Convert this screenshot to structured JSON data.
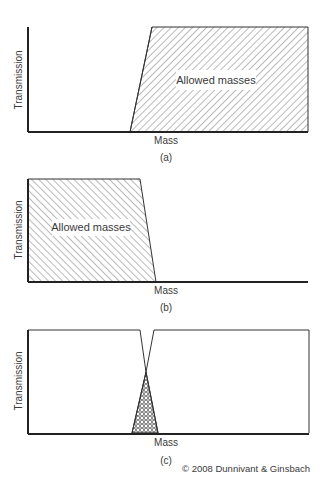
{
  "figure": {
    "copyright": "© 2008 Dunnivant & Ginsbach",
    "panels": [
      {
        "id": "a",
        "caption": "(a)",
        "xlabel": "Mass",
        "ylabel": "Transmission",
        "region_label": "Allowed masses",
        "filter": "high-pass"
      },
      {
        "id": "b",
        "caption": "(b)",
        "xlabel": "Mass",
        "ylabel": "Transmission",
        "region_label": "Allowed masses",
        "filter": "low-pass"
      },
      {
        "id": "c",
        "caption": "(c)",
        "xlabel": "Mass",
        "ylabel": "Transmission",
        "region_label": "",
        "filter": "band-pass (overlap)"
      }
    ]
  },
  "colors": {
    "line": "#222222",
    "hatch": "#555555",
    "text": "#3a3a3a",
    "background": "#ffffff"
  }
}
